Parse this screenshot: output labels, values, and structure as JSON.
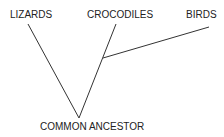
{
  "diagram": {
    "type": "cladogram",
    "taxa": [
      {
        "label": "LIZARDS"
      },
      {
        "label": "CROCODILES"
      },
      {
        "label": "BIRDS"
      }
    ],
    "root": {
      "label": "COMMON ANCESTOR"
    },
    "line_color": "#333333",
    "text_color": "#222222"
  }
}
